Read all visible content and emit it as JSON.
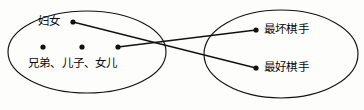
{
  "diagram": {
    "type": "venn-mapping-diagram",
    "stroke_color": "#111111",
    "text_color": "#0b0b0b",
    "background_color": "#fdfdfc",
    "left_set": {
      "name": "left-ellipse",
      "cx": 87,
      "cy": 52,
      "rx": 79,
      "ry": 41,
      "labels": {
        "women": "妇女",
        "kin": "兄弟、儿子、女儿"
      },
      "nodes": [
        {
          "id": "women-node",
          "x": 73,
          "y": 22
        },
        {
          "id": "brother-node",
          "x": 43,
          "y": 47
        },
        {
          "id": "son-node",
          "x": 82,
          "y": 47
        },
        {
          "id": "daughter-node",
          "x": 118,
          "y": 47
        }
      ]
    },
    "right_set": {
      "name": "right-ellipse",
      "cx": 281,
      "cy": 54,
      "rx": 77,
      "ry": 44,
      "labels": {
        "worst_player": "最坏棋手",
        "best_player": "最好棋手"
      },
      "nodes": [
        {
          "id": "worst-node",
          "x": 256,
          "y": 30
        },
        {
          "id": "best-node",
          "x": 256,
          "y": 68
        }
      ]
    },
    "edges": [
      {
        "id": "edge-women-to-best",
        "x1": 73,
        "y1": 22,
        "x2": 256,
        "y2": 68
      },
      {
        "id": "edge-daughter-to-worst",
        "x1": 118,
        "y1": 47,
        "x2": 256,
        "y2": 30
      }
    ]
  }
}
